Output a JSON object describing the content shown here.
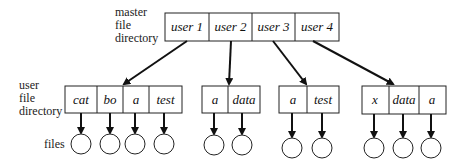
{
  "labels": {
    "master": [
      "master",
      "file",
      "directory"
    ],
    "user": [
      "user",
      "file",
      "directory"
    ],
    "files": "files"
  },
  "master_directory": {
    "cells": [
      "user 1",
      "user 2",
      "user 3",
      "user 4"
    ]
  },
  "user_directories": [
    {
      "owner": "user 1",
      "entries": [
        "cat",
        "bo",
        "a",
        "test"
      ]
    },
    {
      "owner": "user 2",
      "entries": [
        "a",
        "data"
      ]
    },
    {
      "owner": "user 3",
      "entries": [
        "a",
        "test"
      ]
    },
    {
      "owner": "user 4",
      "entries": [
        "x",
        "data",
        "a"
      ]
    }
  ]
}
